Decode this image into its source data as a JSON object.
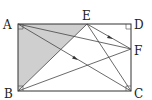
{
  "diagram": {
    "type": "geometry",
    "shape": "rectangle ABCD",
    "points": {
      "A": {
        "label": "A",
        "x": 18,
        "y": 24
      },
      "B": {
        "label": "B",
        "x": 18,
        "y": 91
      },
      "C": {
        "label": "C",
        "x": 131,
        "y": 91
      },
      "D": {
        "label": "D",
        "x": 131,
        "y": 24
      },
      "E": {
        "label": "E",
        "x": 87,
        "y": 24
      },
      "F": {
        "label": "F",
        "x": 131,
        "y": 49
      }
    },
    "segments": [
      "AB",
      "BC",
      "CD",
      "DA",
      "AF",
      "AC",
      "EB",
      "EC",
      "EF",
      "BF"
    ],
    "shaded_region": "triangle ABE",
    "right_angle_marks": [
      "A",
      "B",
      "C",
      "D"
    ],
    "arrows_on": [
      "AC",
      "EF"
    ],
    "colors": {
      "stroke": "#333333",
      "shade": "#cfcfcf"
    }
  }
}
